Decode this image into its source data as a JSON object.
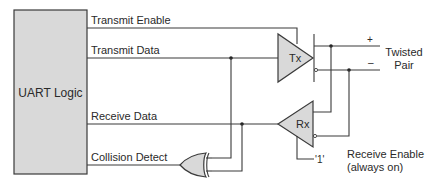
{
  "diagram": {
    "blocks": {
      "uart": {
        "label": "UART Logic"
      },
      "tx": {
        "label": "Tx"
      },
      "rx": {
        "label": "Rx"
      },
      "xor": {
        "label": ""
      }
    },
    "signals": {
      "transmit_enable": "Transmit Enable",
      "transmit_data": "Transmit Data",
      "receive_data": "Receive Data",
      "collision_detect": "Collision Detect"
    },
    "bus": {
      "plus": "+",
      "minus": "–",
      "label_line1": "Twisted",
      "label_line2": "Pair"
    },
    "receive_enable": {
      "value": "'1'",
      "label_line1": "Receive Enable",
      "label_line2": "(always on)"
    },
    "colors": {
      "block_fill": "#d9d9d9",
      "line": "#3a3a3a",
      "text": "#2a2a2a"
    }
  }
}
